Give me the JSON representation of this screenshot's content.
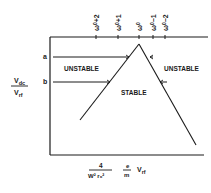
{
  "diagram": {
    "type": "stability-diagram",
    "colors": {
      "ink": "#1a1a1a",
      "background": "#ffffff"
    },
    "top_ticks": [
      {
        "base": "ω",
        "sub": "0",
        "suffix": "+2",
        "x": 96
      },
      {
        "base": "ω",
        "sub": "0",
        "suffix": "+1",
        "x": 118
      },
      {
        "base": "ω",
        "sub": "0",
        "suffix": "",
        "x": 139
      },
      {
        "base": "ω",
        "sub": "0",
        "suffix": "−1",
        "x": 153
      },
      {
        "base": "ω",
        "sub": "0",
        "suffix": "−2",
        "x": 165
      }
    ],
    "y_axis": {
      "label_numerator": "V",
      "label_numerator_sub": "dc",
      "label_denominator": "V",
      "label_denominator_sub": "rf",
      "markers": [
        {
          "label": "a",
          "y": 57
        },
        {
          "label": "b",
          "y": 82
        }
      ]
    },
    "x_axis": {
      "frac1_numerator": "4",
      "frac1_denominator": "W² r₀²",
      "frac2_numerator": "e",
      "frac2_denominator": "m",
      "trailing": "V",
      "trailing_sub": "rf"
    },
    "regions": {
      "left_unstable": "UNSTABLE",
      "right_unstable": "UNSTABLE",
      "stable": "STABLE"
    }
  }
}
